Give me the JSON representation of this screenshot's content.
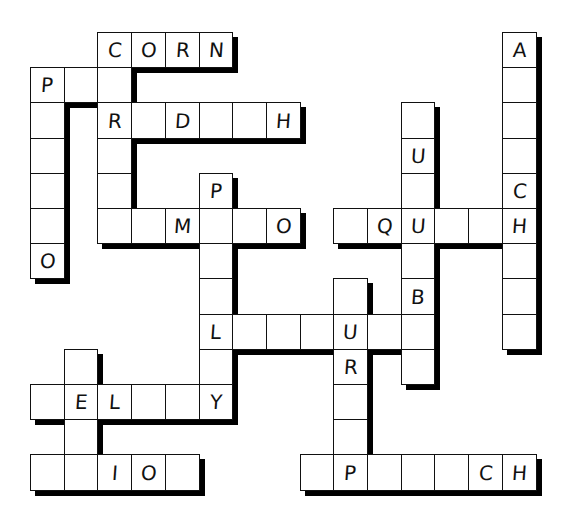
{
  "puzzle": {
    "type": "crossword",
    "grid": {
      "origin_x": 30,
      "origin_y": 32,
      "cell_w": 33.7,
      "cell_h": 35.2,
      "border_color": "#111111",
      "shadow_color": "#000000",
      "background": "#ffffff"
    },
    "cells": [
      {
        "c": 2,
        "r": 0,
        "letter": "C"
      },
      {
        "c": 3,
        "r": 0,
        "letter": "O"
      },
      {
        "c": 4,
        "r": 0,
        "letter": "R"
      },
      {
        "c": 5,
        "r": 0,
        "letter": "N"
      },
      {
        "c": 14,
        "r": 0,
        "letter": "A"
      },
      {
        "c": 0,
        "r": 1,
        "letter": "P"
      },
      {
        "c": 1,
        "r": 1,
        "letter": ""
      },
      {
        "c": 2,
        "r": 1,
        "letter": ""
      },
      {
        "c": 14,
        "r": 1,
        "letter": ""
      },
      {
        "c": 0,
        "r": 2,
        "letter": ""
      },
      {
        "c": 2,
        "r": 2,
        "letter": "R"
      },
      {
        "c": 3,
        "r": 2,
        "letter": ""
      },
      {
        "c": 4,
        "r": 2,
        "letter": "D"
      },
      {
        "c": 5,
        "r": 2,
        "letter": ""
      },
      {
        "c": 6,
        "r": 2,
        "letter": ""
      },
      {
        "c": 7,
        "r": 2,
        "letter": "H"
      },
      {
        "c": 11,
        "r": 2,
        "letter": ""
      },
      {
        "c": 14,
        "r": 2,
        "letter": ""
      },
      {
        "c": 0,
        "r": 3,
        "letter": ""
      },
      {
        "c": 2,
        "r": 3,
        "letter": ""
      },
      {
        "c": 11,
        "r": 3,
        "letter": "U"
      },
      {
        "c": 14,
        "r": 3,
        "letter": ""
      },
      {
        "c": 0,
        "r": 4,
        "letter": ""
      },
      {
        "c": 2,
        "r": 4,
        "letter": ""
      },
      {
        "c": 5,
        "r": 4,
        "letter": "P"
      },
      {
        "c": 11,
        "r": 4,
        "letter": ""
      },
      {
        "c": 14,
        "r": 4,
        "letter": "C"
      },
      {
        "c": 0,
        "r": 5,
        "letter": ""
      },
      {
        "c": 2,
        "r": 5,
        "letter": ""
      },
      {
        "c": 3,
        "r": 5,
        "letter": ""
      },
      {
        "c": 4,
        "r": 5,
        "letter": "M"
      },
      {
        "c": 5,
        "r": 5,
        "letter": ""
      },
      {
        "c": 6,
        "r": 5,
        "letter": ""
      },
      {
        "c": 7,
        "r": 5,
        "letter": "O"
      },
      {
        "c": 9,
        "r": 5,
        "letter": ""
      },
      {
        "c": 10,
        "r": 5,
        "letter": "Q"
      },
      {
        "c": 11,
        "r": 5,
        "letter": "U"
      },
      {
        "c": 12,
        "r": 5,
        "letter": ""
      },
      {
        "c": 13,
        "r": 5,
        "letter": ""
      },
      {
        "c": 14,
        "r": 5,
        "letter": "H"
      },
      {
        "c": 0,
        "r": 6,
        "letter": "O"
      },
      {
        "c": 5,
        "r": 6,
        "letter": ""
      },
      {
        "c": 11,
        "r": 6,
        "letter": ""
      },
      {
        "c": 14,
        "r": 6,
        "letter": ""
      },
      {
        "c": 5,
        "r": 7,
        "letter": ""
      },
      {
        "c": 9,
        "r": 7,
        "letter": ""
      },
      {
        "c": 11,
        "r": 7,
        "letter": "B"
      },
      {
        "c": 14,
        "r": 7,
        "letter": ""
      },
      {
        "c": 5,
        "r": 8,
        "letter": "L"
      },
      {
        "c": 6,
        "r": 8,
        "letter": ""
      },
      {
        "c": 7,
        "r": 8,
        "letter": ""
      },
      {
        "c": 8,
        "r": 8,
        "letter": ""
      },
      {
        "c": 9,
        "r": 8,
        "letter": "U"
      },
      {
        "c": 10,
        "r": 8,
        "letter": ""
      },
      {
        "c": 11,
        "r": 8,
        "letter": ""
      },
      {
        "c": 14,
        "r": 8,
        "letter": ""
      },
      {
        "c": 1,
        "r": 9,
        "letter": ""
      },
      {
        "c": 5,
        "r": 9,
        "letter": ""
      },
      {
        "c": 9,
        "r": 9,
        "letter": "R"
      },
      {
        "c": 11,
        "r": 9,
        "letter": ""
      },
      {
        "c": 0,
        "r": 10,
        "letter": ""
      },
      {
        "c": 1,
        "r": 10,
        "letter": "E"
      },
      {
        "c": 2,
        "r": 10,
        "letter": "L"
      },
      {
        "c": 3,
        "r": 10,
        "letter": ""
      },
      {
        "c": 4,
        "r": 10,
        "letter": ""
      },
      {
        "c": 5,
        "r": 10,
        "letter": "Y"
      },
      {
        "c": 9,
        "r": 10,
        "letter": ""
      },
      {
        "c": 1,
        "r": 11,
        "letter": ""
      },
      {
        "c": 9,
        "r": 11,
        "letter": ""
      },
      {
        "c": 0,
        "r": 12,
        "letter": ""
      },
      {
        "c": 1,
        "r": 12,
        "letter": ""
      },
      {
        "c": 2,
        "r": 12,
        "letter": "I"
      },
      {
        "c": 3,
        "r": 12,
        "letter": "O"
      },
      {
        "c": 4,
        "r": 12,
        "letter": ""
      },
      {
        "c": 8,
        "r": 12,
        "letter": ""
      },
      {
        "c": 9,
        "r": 12,
        "letter": "P"
      },
      {
        "c": 10,
        "r": 12,
        "letter": ""
      },
      {
        "c": 11,
        "r": 12,
        "letter": ""
      },
      {
        "c": 12,
        "r": 12,
        "letter": ""
      },
      {
        "c": 13,
        "r": 12,
        "letter": "C"
      },
      {
        "c": 14,
        "r": 12,
        "letter": "H"
      }
    ]
  }
}
